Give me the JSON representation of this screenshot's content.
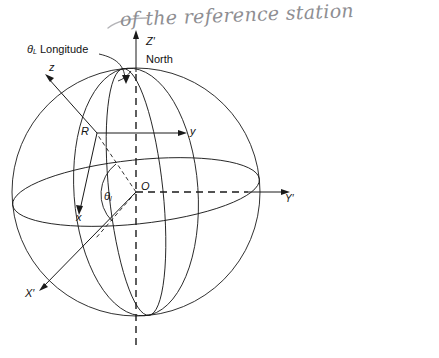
{
  "figure": {
    "kind": "geodetic-sphere-coordinate-diagram",
    "background_color": "#ffffff",
    "line_color": "#1a1a1a",
    "annotation_color": "#8e8e92",
    "width": 439,
    "height": 358
  },
  "handwriting": {
    "note": "of the reference station"
  },
  "labels": {
    "z_prime": "Z",
    "z_prime_mark": "′",
    "north": "North",
    "longitude_symbol": "θ",
    "longitude_subscript": "L",
    "longitude_word": "Longitude",
    "z_local": "z",
    "y_local": "y",
    "x_local": "x",
    "point_r": "R",
    "origin_o": "O",
    "latitude_symbol": "θ",
    "latitude_subscript": "l",
    "x_prime": "X",
    "x_prime_mark": "′",
    "y_prime": "Y",
    "y_prime_mark": "′"
  },
  "geometry": {
    "sphere_center_x": 136,
    "sphere_center_y": 192,
    "sphere_radius": 124,
    "point_r_x": 96,
    "point_r_y": 133,
    "pole_x": 136,
    "pole_y": 70
  }
}
